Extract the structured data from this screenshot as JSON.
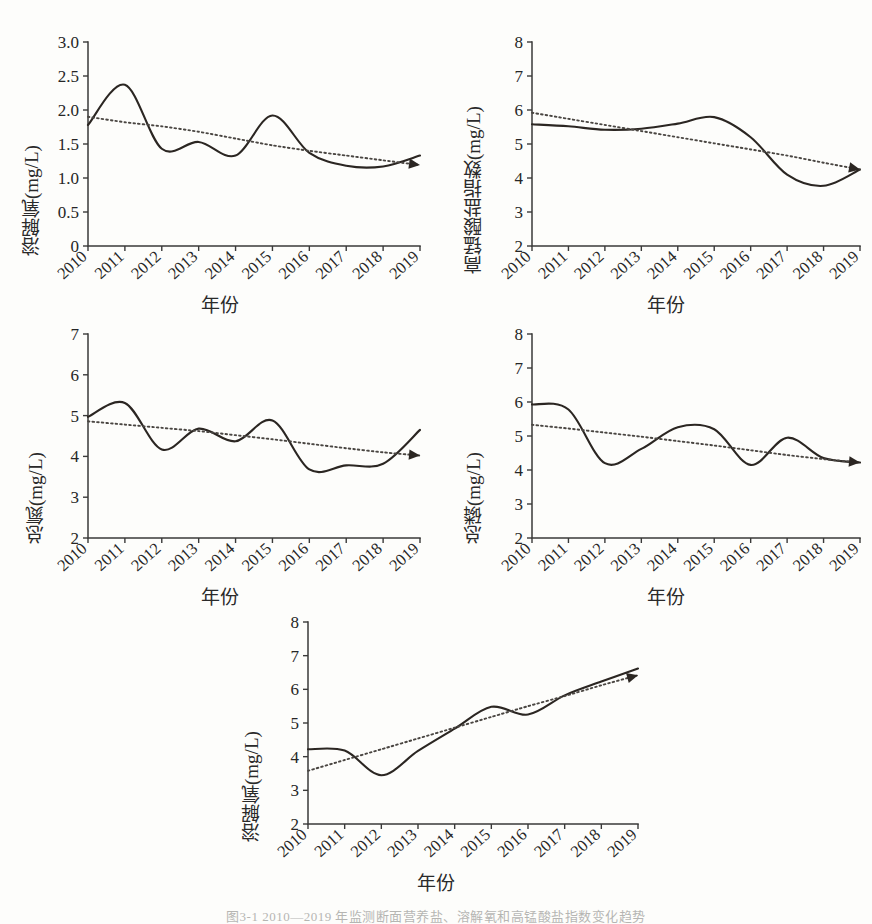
{
  "figure": {
    "caption": "图3-1  2010—2019 年监测断面营养盐、溶解氧和高锰酸盐指数变化趋势",
    "xlabel": "年份",
    "axis_color": "#3a3a3a",
    "curve_color": "#2b2622",
    "trend_color": "#4a4642"
  },
  "chart_data": [
    {
      "type": "line",
      "panel": "a",
      "title": "",
      "ylabel": "溶解氧(mg/L)",
      "xlabel": "年份",
      "x": [
        2010,
        2011,
        2012,
        2013,
        2014,
        2015,
        2016,
        2017,
        2018,
        2019
      ],
      "xtick_labels": [
        "2010",
        "2011",
        "2012",
        "2013",
        "2014",
        "2015",
        "2016",
        "2017",
        "2018",
        "2019"
      ],
      "ytick_labels": [
        "0",
        "0.5",
        "1.0",
        "1.5",
        "2.0",
        "2.5",
        "3.0"
      ],
      "ylim": [
        0,
        3.0
      ],
      "xlim": [
        2010,
        2019
      ],
      "grid": false,
      "legend": "none",
      "series": [
        {
          "name": "溶解氧",
          "style": "solid",
          "values": [
            1.78,
            2.37,
            1.43,
            1.53,
            1.33,
            1.92,
            1.37,
            1.18,
            1.17,
            1.33
          ]
        },
        {
          "name": "线性趋势",
          "style": "dotted-arrow",
          "values": [
            1.9,
            1.82,
            1.76,
            1.68,
            1.58,
            1.48,
            1.4,
            1.33,
            1.26,
            1.19
          ]
        }
      ]
    },
    {
      "type": "line",
      "panel": "b",
      "title": "",
      "ylabel": "高锰酸盐指数(mg/L)",
      "xlabel": "年份",
      "x": [
        2010,
        2011,
        2012,
        2013,
        2014,
        2015,
        2016,
        2017,
        2018,
        2019
      ],
      "xtick_labels": [
        "2010",
        "2011",
        "2012",
        "2013",
        "2014",
        "2015",
        "2016",
        "2017",
        "2018",
        "2019"
      ],
      "ytick_labels": [
        "2",
        "3",
        "4",
        "5",
        "6",
        "7",
        "8"
      ],
      "ylim": [
        2,
        8
      ],
      "xlim": [
        2010,
        2019
      ],
      "grid": false,
      "legend": "none",
      "series": [
        {
          "name": "高锰酸盐指数",
          "style": "solid",
          "values": [
            5.58,
            5.52,
            5.42,
            5.45,
            5.6,
            5.79,
            5.2,
            4.1,
            3.77,
            4.25
          ]
        },
        {
          "name": "线性趋势",
          "style": "dotted-arrow",
          "values": [
            5.92,
            5.74,
            5.56,
            5.38,
            5.2,
            5.02,
            4.84,
            4.66,
            4.45,
            4.25
          ]
        }
      ]
    },
    {
      "type": "line",
      "panel": "c",
      "title": "",
      "ylabel": "总氮(mg/L)",
      "xlabel": "年份",
      "x": [
        2010,
        2011,
        2012,
        2013,
        2014,
        2015,
        2016,
        2017,
        2018,
        2019
      ],
      "xtick_labels": [
        "2010",
        "2011",
        "2012",
        "2013",
        "2014",
        "2015",
        "2016",
        "2017",
        "2018",
        "2019"
      ],
      "ytick_labels": [
        "2",
        "3",
        "4",
        "5",
        "6",
        "7"
      ],
      "ylim": [
        2,
        7
      ],
      "xlim": [
        2010,
        2019
      ],
      "grid": false,
      "legend": "none",
      "series": [
        {
          "name": "总氮",
          "style": "solid",
          "values": [
            4.97,
            5.31,
            4.17,
            4.68,
            4.37,
            4.88,
            3.68,
            3.78,
            3.82,
            4.65
          ]
        },
        {
          "name": "线性趋势",
          "style": "dotted-arrow",
          "values": [
            4.86,
            4.78,
            4.7,
            4.62,
            4.52,
            4.42,
            4.31,
            4.2,
            4.1,
            4.02
          ]
        }
      ]
    },
    {
      "type": "line",
      "panel": "d",
      "title": "",
      "ylabel": "总磷(mg/L)",
      "xlabel": "年份",
      "x": [
        2010,
        2011,
        2012,
        2013,
        2014,
        2015,
        2016,
        2017,
        2018,
        2019
      ],
      "xtick_labels": [
        "2010",
        "2011",
        "2012",
        "2013",
        "2014",
        "2015",
        "2016",
        "2017",
        "2018",
        "2019"
      ],
      "ytick_labels": [
        "2",
        "3",
        "4",
        "5",
        "6",
        "7",
        "8"
      ],
      "ylim": [
        2,
        8
      ],
      "xlim": [
        2010,
        2019
      ],
      "grid": false,
      "legend": "none",
      "series": [
        {
          "name": "总磷",
          "style": "solid",
          "values": [
            5.93,
            5.78,
            4.2,
            4.62,
            5.26,
            5.2,
            4.15,
            4.95,
            4.35,
            4.22
          ]
        },
        {
          "name": "线性趋势",
          "style": "dotted-arrow",
          "values": [
            5.33,
            5.22,
            5.1,
            4.98,
            4.85,
            4.72,
            4.58,
            4.44,
            4.32,
            4.22
          ]
        }
      ]
    },
    {
      "type": "line",
      "panel": "e",
      "title": "",
      "ylabel": "溶解氧(mg/L)",
      "xlabel": "年份",
      "x": [
        2010,
        2011,
        2012,
        2013,
        2014,
        2015,
        2016,
        2017,
        2018,
        2019
      ],
      "xtick_labels": [
        "2010",
        "2011",
        "2012",
        "2013",
        "2014",
        "2015",
        "2016",
        "2017",
        "2018",
        "2019"
      ],
      "ytick_labels": [
        "2",
        "3",
        "4",
        "5",
        "6",
        "7",
        "8"
      ],
      "ylim": [
        2,
        8
      ],
      "xlim": [
        2010,
        2019
      ],
      "grid": false,
      "legend": "none",
      "series": [
        {
          "name": "溶解氧",
          "style": "solid",
          "values": [
            4.22,
            4.18,
            3.45,
            4.17,
            4.83,
            5.48,
            5.25,
            5.82,
            6.23,
            6.62
          ]
        },
        {
          "name": "线性趋势",
          "style": "dotted-arrow",
          "values": [
            3.58,
            3.9,
            4.22,
            4.54,
            4.86,
            5.18,
            5.5,
            5.8,
            6.12,
            6.42
          ]
        }
      ]
    }
  ]
}
